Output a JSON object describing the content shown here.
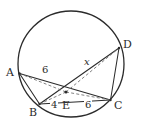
{
  "figure": {
    "stroke_color": "#2b2b2b",
    "dash_color": "#6b6b6b",
    "background": "#ffffff",
    "width": 145,
    "height": 130
  },
  "circle": {
    "center_x": 71,
    "center_y": 64,
    "radius": 53
  },
  "points": [
    {
      "id": "A",
      "label": "A",
      "x": 19.5,
      "y": 73.5,
      "label_x": 6,
      "label_y": 67
    },
    {
      "id": "B",
      "label": "B",
      "x": 39.5,
      "y": 104.0,
      "label_x": 29,
      "label_y": 107
    },
    {
      "id": "C",
      "label": "C",
      "x": 110.5,
      "y": 100.0,
      "label_x": 114,
      "label_y": 100
    },
    {
      "id": "D",
      "label": "D",
      "x": 119.0,
      "y": 48.0,
      "label_x": 123,
      "label_y": 39
    },
    {
      "id": "E",
      "label": "E",
      "x": 66.0,
      "y": 92.0,
      "label_x": 62,
      "label_y": 100
    }
  ],
  "solid_segments": [
    {
      "name": "chord-a-c",
      "from": "A",
      "to": "C"
    },
    {
      "name": "chord-b-d",
      "from": "B",
      "to": "D"
    },
    {
      "name": "side-a-b",
      "from": "A",
      "to": "B"
    },
    {
      "name": "side-b-c",
      "from": "B",
      "to": "C"
    },
    {
      "name": "side-c-d",
      "from": "C",
      "to": "D"
    }
  ],
  "dashed_segments": [
    {
      "name": "measure-a-e",
      "from": "A",
      "to": "E"
    },
    {
      "name": "measure-e-c",
      "from": "E",
      "to": "C"
    },
    {
      "name": "measure-b-e",
      "from": "B",
      "to": "E"
    },
    {
      "name": "measure-e-d",
      "from": "E",
      "to": "D"
    }
  ],
  "measures": [
    {
      "name": "length-ae",
      "text": "6",
      "x": 41,
      "y": 65,
      "italic": false
    },
    {
      "name": "length-ec",
      "text": "6",
      "x": 84,
      "y": 100,
      "italic": false
    },
    {
      "name": "length-be",
      "text": "4",
      "x": 50,
      "y": 100,
      "italic": false
    },
    {
      "name": "length-ed",
      "text": "x",
      "x": 83,
      "y": 57,
      "italic": true
    }
  ]
}
